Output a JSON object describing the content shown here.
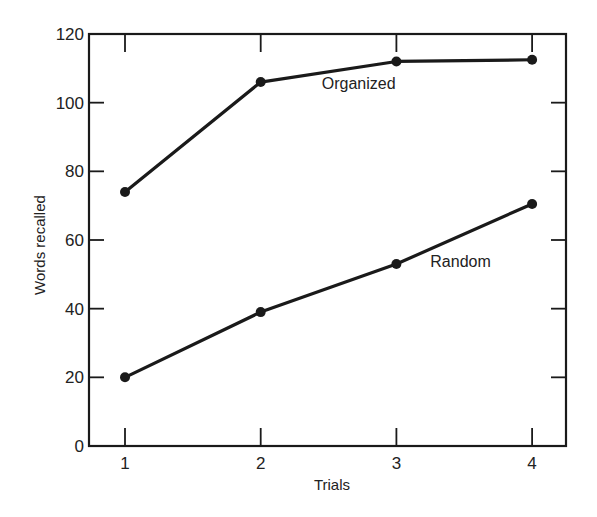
{
  "chart_data": {
    "type": "line",
    "title": "",
    "xlabel": "Trials",
    "ylabel": "Words recalled",
    "x": [
      1,
      2,
      3,
      4
    ],
    "categories": [
      "1",
      "2",
      "3",
      "4"
    ],
    "xlim": [
      0.75,
      4.25
    ],
    "ylim": [
      0,
      120
    ],
    "yticks": [
      0,
      20,
      40,
      60,
      80,
      100,
      120
    ],
    "xticks": [
      1,
      2,
      3,
      4
    ],
    "grid": false,
    "legend": "inline labels",
    "series": [
      {
        "name": "Organized",
        "values": [
          74,
          106,
          112,
          112.5
        ],
        "label_pos": {
          "x": 2.45,
          "y": 104
        }
      },
      {
        "name": "Random",
        "values": [
          20,
          39,
          53,
          70.5
        ],
        "label_pos": {
          "x": 3.25,
          "y": 52
        }
      }
    ],
    "colors": {
      "line": "#1a1a1a",
      "axis": "#1a1a1a",
      "text": "#222222"
    }
  }
}
